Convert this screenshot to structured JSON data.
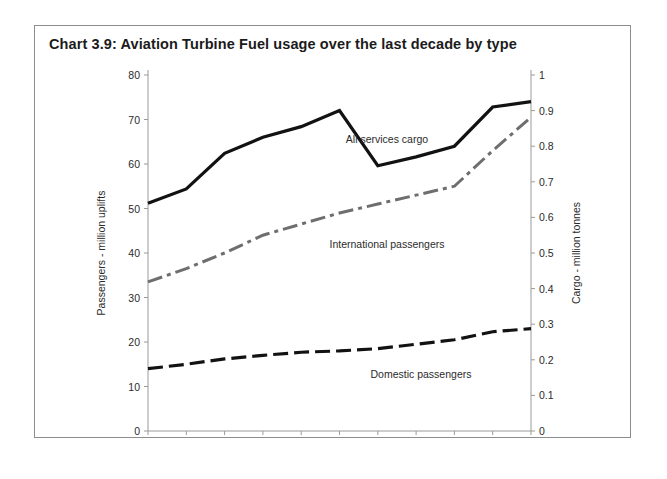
{
  "title": "Chart 3.9:  Aviation Turbine Fuel usage over the last decade by type",
  "axes": {
    "left_label": "Passengers - million uplifts",
    "right_label": "Cargo - million tonnes",
    "left_ticks": [
      "0",
      "10",
      "20",
      "30",
      "40",
      "50",
      "60",
      "70",
      "80"
    ],
    "right_ticks": [
      "0",
      "0.1",
      "0.2",
      "0.3",
      "0.4",
      "0.5",
      "0.6",
      "0.7",
      "0.8",
      "0.9",
      "1"
    ],
    "x_ticks": [
      "1995",
      "1996",
      "1997",
      "1998",
      "1999",
      "2000",
      "2001",
      "2002",
      "2003",
      "2004",
      "2005"
    ]
  },
  "series_labels": {
    "cargo": "All services cargo",
    "international": "International passengers",
    "domestic": "Domestic passengers"
  },
  "colors": {
    "cargo": "#121212",
    "international": "#6e6e6e",
    "domestic": "#121212",
    "axis": "#9a9a9a",
    "border": "#8d8d8d",
    "text": "#1b1b1b"
  },
  "chart_data": {
    "type": "line",
    "title": "Chart 3.9:  Aviation Turbine Fuel usage over the last decade by type",
    "xlabel": "",
    "ylabel": "Passengers - million uplifts",
    "y2label": "Cargo - million tonnes",
    "x": [
      1995,
      1996,
      1997,
      1998,
      1999,
      2000,
      2001,
      2002,
      2003,
      2004,
      2005
    ],
    "ylim": [
      0,
      80
    ],
    "y2lim": [
      0,
      1
    ],
    "grid": false,
    "legend": "inline-annotations",
    "series": [
      {
        "name": "All services cargo",
        "axis": "right",
        "units": "million tonnes",
        "style": "solid",
        "color": "#121212",
        "values": [
          0.64,
          0.68,
          0.78,
          0.825,
          0.855,
          0.9,
          0.745,
          0.77,
          0.8,
          0.91,
          0.925
        ]
      },
      {
        "name": "International passengers",
        "axis": "left",
        "units": "million uplifts",
        "style": "dash-dot",
        "color": "#6e6e6e",
        "values": [
          33.5,
          36.5,
          40,
          44,
          46.5,
          49,
          51,
          53,
          55,
          63,
          70.5
        ]
      },
      {
        "name": "Domestic passengers",
        "axis": "left",
        "units": "million uplifts",
        "style": "dashed",
        "color": "#121212",
        "values": [
          14,
          15,
          16.2,
          17,
          17.7,
          18,
          18.5,
          19.5,
          20.5,
          22.3,
          23
        ]
      }
    ]
  }
}
